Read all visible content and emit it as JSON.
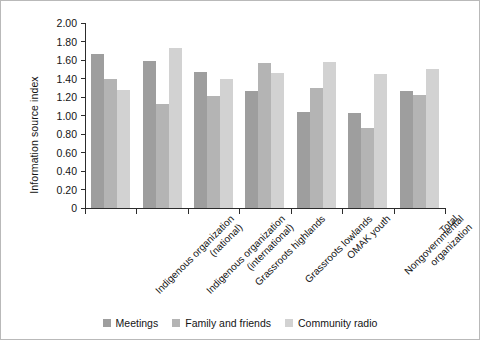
{
  "chart_data": {
    "type": "bar",
    "title": "",
    "xlabel": "",
    "ylabel": "Information source index",
    "ylim": [
      0,
      2.0
    ],
    "ytick_labels": [
      "2.00",
      "1.80",
      "1.60",
      "1.40",
      "1.20",
      "1.00",
      "0.80",
      "0.60",
      "0.40",
      "0.20",
      "0"
    ],
    "ytick_values": [
      2.0,
      1.8,
      1.6,
      1.4,
      1.2,
      1.0,
      0.8,
      0.6,
      0.4,
      0.2,
      0
    ],
    "grid": false,
    "legend_position": "bottom-center",
    "categories": [
      "Indigenous organization (national)",
      "Indigenous organization (international)",
      "Grassroots highlands",
      "Grassroots lowlands",
      "OMAK youth",
      "Nongovernmental organization",
      "Total"
    ],
    "category_lines": [
      [
        "Indigenous organization",
        "(national)"
      ],
      [
        "Indigenous organization",
        "(international)"
      ],
      [
        "Grassroots highlands",
        ""
      ],
      [
        "Grassroots lowlands",
        ""
      ],
      [
        "OMAK youth",
        ""
      ],
      [
        "Nongovernmental",
        "organization"
      ],
      [
        "Total",
        ""
      ]
    ],
    "series": [
      {
        "name": "Meetings",
        "color": "#9e9e9e",
        "values": [
          1.66,
          1.59,
          1.47,
          1.27,
          1.04,
          1.03,
          1.27
        ]
      },
      {
        "name": "Family and friends",
        "color": "#b4b4b4",
        "values": [
          1.4,
          1.12,
          1.21,
          1.57,
          1.3,
          0.87,
          1.22
        ]
      },
      {
        "name": "Community radio",
        "color": "#d2d2d2",
        "values": [
          1.28,
          1.73,
          1.39,
          1.46,
          1.58,
          1.45,
          1.5
        ]
      }
    ]
  },
  "legend": {
    "items": [
      {
        "label": "Meetings"
      },
      {
        "label": "Family and friends"
      },
      {
        "label": "Community radio"
      }
    ]
  }
}
